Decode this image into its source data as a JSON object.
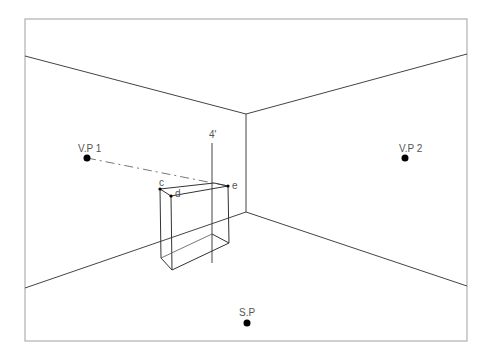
{
  "diagram": {
    "labels": {
      "vp1": "V.P 1",
      "vp2": "V.P 2",
      "sp": "S.P",
      "height_mark": "4'",
      "point_c": "c",
      "point_d": "d",
      "point_e": "e"
    },
    "colors": {
      "line": "#444444",
      "frame": "#999999",
      "dot": "#000000",
      "text": "#555555"
    },
    "points": {
      "vp1": [
        87,
        158
      ],
      "vp2": [
        405,
        158
      ],
      "sp": [
        247,
        323
      ],
      "corner_top": [
        246,
        114
      ],
      "corner_bottom": [
        246,
        212
      ],
      "c": [
        160,
        189
      ],
      "d": [
        171,
        196
      ],
      "e": [
        228,
        186
      ]
    }
  }
}
